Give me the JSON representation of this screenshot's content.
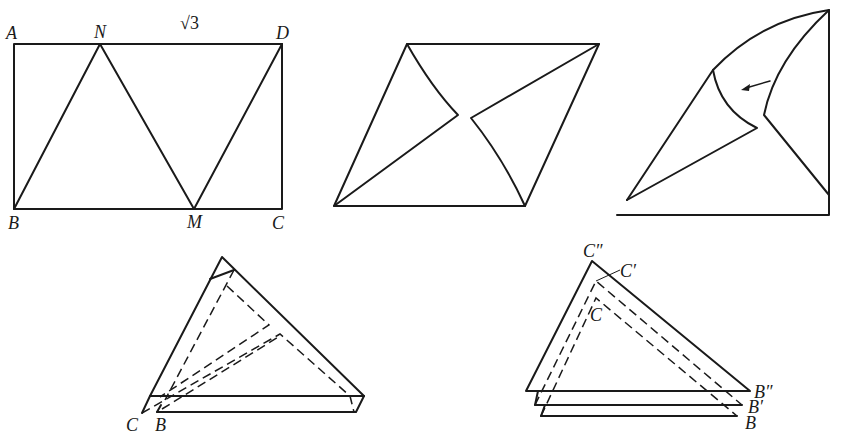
{
  "figure1": {
    "labels": {
      "A": "A",
      "N": "N",
      "D": "D",
      "B": "B",
      "M": "M",
      "C": "C"
    },
    "side_label": "√3"
  },
  "figure4": {
    "labels": {
      "C": "C",
      "B": "B"
    }
  },
  "figure5": {
    "labels": {
      "C2": "C″",
      "C1": "C′",
      "C0": "C",
      "B2": "B″",
      "B1": "B′",
      "B0": "B"
    }
  },
  "colors": {
    "ink": "#1a1a1a",
    "background": "#ffffff"
  }
}
